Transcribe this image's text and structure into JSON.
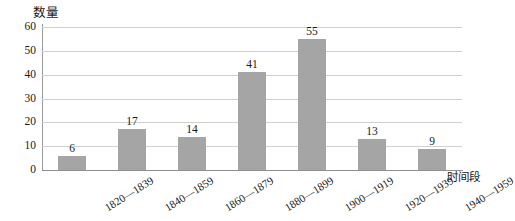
{
  "chart_data": {
    "type": "bar",
    "title": "",
    "subtitle": "",
    "ylabel": "数量",
    "xlabel": "时间段",
    "categories": [
      "1820—1839",
      "1840—1859",
      "1860—1879",
      "1880—1899",
      "1900—1919",
      "1920—1939",
      "1940—1959"
    ],
    "values": [
      6,
      17,
      14,
      41,
      55,
      13,
      9
    ],
    "data_labels": [
      "6",
      "17",
      "14",
      "41",
      "55",
      "13",
      "9"
    ],
    "ylim": [
      0,
      60
    ],
    "yticks": [
      0,
      10,
      20,
      30,
      40,
      50,
      60
    ],
    "ytick_labels": [
      "0",
      "10",
      "20",
      "30",
      "40",
      "50",
      "60"
    ],
    "grid": "horizontal",
    "legend": "none",
    "bar_color": "#a5a5a5",
    "gridline_color": "#d0d0d0",
    "axis_color": "#8f8f8f",
    "text_color": "#1a1a1a",
    "background": "#ffffff",
    "xtick_rotation_deg": -32
  }
}
